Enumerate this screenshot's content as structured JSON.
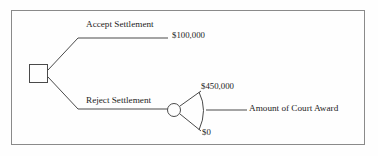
{
  "diagram": {
    "type": "decision-tree",
    "title": "",
    "nodes": [
      {
        "id": "decision",
        "shape": "square",
        "label": ""
      },
      {
        "id": "chance",
        "shape": "circle",
        "label": ""
      }
    ],
    "branches": [
      {
        "id": "accept",
        "label": "Accept Settlement",
        "payoff": "$100,000"
      },
      {
        "id": "reject",
        "label": "Reject Settlement",
        "payoff": ""
      }
    ],
    "chance_outcomes": {
      "upper_payoff": "$450,000",
      "lower_payoff": "$0",
      "variable_label": "Amount of Court Award"
    },
    "colors": {
      "line": "#4a4a4a",
      "border": "#8a8a8a",
      "text": "#1d1d1d",
      "background": "#fefefe"
    }
  }
}
